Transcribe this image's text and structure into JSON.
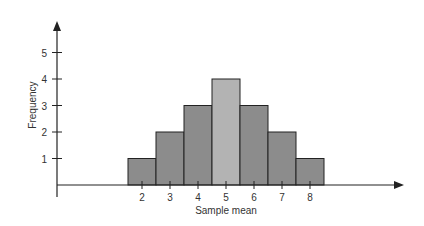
{
  "chart_data": {
    "type": "bar",
    "title": "",
    "xlabel": "Sample mean",
    "ylabel": "Frequency",
    "categories": [
      "2",
      "3",
      "4",
      "5",
      "6",
      "7",
      "8"
    ],
    "values": [
      1,
      2,
      3,
      4,
      3,
      2,
      1
    ],
    "y_ticks": [
      "1",
      "2",
      "3",
      "4",
      "5"
    ],
    "ylim": [
      0,
      6
    ],
    "grid": false,
    "legend": null,
    "colors": {
      "bar": "#8c8c8c",
      "bar_highlight": "#b3b3b3",
      "axis": "#222222",
      "stroke": "#222222"
    }
  }
}
